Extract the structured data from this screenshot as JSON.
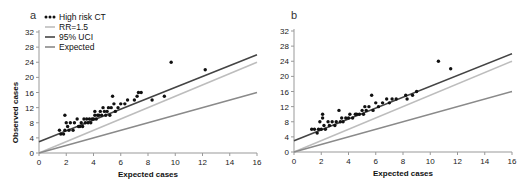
{
  "chart_data": [
    {
      "type": "scatter",
      "panel_label": "a",
      "xlabel": "Expected cases",
      "ylabel": "Observed cases",
      "xlim": [
        0,
        16
      ],
      "ylim": [
        0,
        32
      ],
      "xticks": [
        0,
        2,
        4,
        6,
        8,
        10,
        12,
        14,
        16
      ],
      "yticks": [
        0,
        4,
        8,
        12,
        16,
        20,
        24,
        28,
        32
      ],
      "grid": false,
      "legend_position": "upper-left",
      "legend": [
        "High risk CT",
        "RR=1.5",
        "95% UCI",
        "Expected"
      ],
      "lines": [
        {
          "name": "RR=1.5",
          "x": [
            0,
            16
          ],
          "y": [
            0,
            24
          ],
          "color": "#bdbdbd"
        },
        {
          "name": "95% UCI",
          "x": [
            0,
            16
          ],
          "y": [
            3,
            26
          ],
          "color": "#444444"
        },
        {
          "name": "Expected",
          "x": [
            0,
            16
          ],
          "y": [
            0,
            16
          ],
          "color": "#8a8a8a"
        }
      ],
      "series": [
        {
          "name": "High risk CT",
          "color": "#111111",
          "points": [
            [
              1.5,
              6
            ],
            [
              1.6,
              5
            ],
            [
              1.8,
              5
            ],
            [
              1.9,
              10
            ],
            [
              1.9,
              6
            ],
            [
              2.0,
              8
            ],
            [
              2.1,
              7
            ],
            [
              2.2,
              6
            ],
            [
              2.3,
              8
            ],
            [
              2.5,
              6
            ],
            [
              2.6,
              8
            ],
            [
              2.8,
              9
            ],
            [
              2.9,
              7
            ],
            [
              3.0,
              7
            ],
            [
              3.1,
              8
            ],
            [
              3.2,
              7
            ],
            [
              3.3,
              9
            ],
            [
              3.4,
              8
            ],
            [
              3.5,
              9
            ],
            [
              3.6,
              8
            ],
            [
              3.7,
              9
            ],
            [
              3.8,
              8
            ],
            [
              3.9,
              9
            ],
            [
              4.0,
              9
            ],
            [
              4.1,
              10
            ],
            [
              4.1,
              11
            ],
            [
              4.2,
              9
            ],
            [
              4.3,
              10
            ],
            [
              4.4,
              10
            ],
            [
              4.5,
              11
            ],
            [
              4.6,
              10
            ],
            [
              4.7,
              12
            ],
            [
              4.8,
              11
            ],
            [
              4.9,
              10
            ],
            [
              5.0,
              11
            ],
            [
              5.1,
              12
            ],
            [
              5.2,
              10
            ],
            [
              5.3,
              12
            ],
            [
              5.4,
              15
            ],
            [
              5.5,
              13
            ],
            [
              5.6,
              11
            ],
            [
              5.8,
              12
            ],
            [
              6.0,
              13
            ],
            [
              6.3,
              13
            ],
            [
              6.5,
              14
            ],
            [
              7.0,
              14
            ],
            [
              7.2,
              15
            ],
            [
              7.3,
              16
            ],
            [
              7.5,
              16
            ],
            [
              8.3,
              14
            ],
            [
              9.2,
              15
            ],
            [
              9.7,
              24
            ],
            [
              12.2,
              22
            ]
          ]
        }
      ]
    },
    {
      "type": "scatter",
      "panel_label": "b",
      "xlabel": "Expected cases",
      "ylabel": "",
      "xlim": [
        0,
        16
      ],
      "ylim": [
        0,
        32
      ],
      "xticks": [
        0,
        2,
        4,
        6,
        8,
        10,
        12,
        14,
        16
      ],
      "yticks": [
        0,
        4,
        8,
        12,
        16,
        20,
        24,
        28,
        32
      ],
      "grid": false,
      "lines": [
        {
          "name": "RR=1.5",
          "x": [
            0,
            16
          ],
          "y": [
            0,
            24
          ],
          "color": "#bdbdbd"
        },
        {
          "name": "95% UCI",
          "x": [
            0,
            16
          ],
          "y": [
            3,
            26
          ],
          "color": "#444444"
        },
        {
          "name": "Expected",
          "x": [
            0,
            16
          ],
          "y": [
            0,
            16
          ],
          "color": "#8a8a8a"
        }
      ],
      "series": [
        {
          "name": "High risk CT",
          "color": "#111111",
          "points": [
            [
              1.3,
              6
            ],
            [
              1.5,
              6
            ],
            [
              1.7,
              5
            ],
            [
              1.8,
              6
            ],
            [
              1.9,
              8
            ],
            [
              2.0,
              6
            ],
            [
              2.1,
              9
            ],
            [
              2.1,
              10
            ],
            [
              2.2,
              7
            ],
            [
              2.3,
              6
            ],
            [
              2.5,
              8
            ],
            [
              2.6,
              7
            ],
            [
              2.8,
              8
            ],
            [
              3.0,
              7
            ],
            [
              3.1,
              8
            ],
            [
              3.3,
              11
            ],
            [
              3.4,
              8
            ],
            [
              3.5,
              9
            ],
            [
              3.6,
              8
            ],
            [
              3.8,
              9
            ],
            [
              4.0,
              9
            ],
            [
              4.1,
              10
            ],
            [
              4.3,
              9
            ],
            [
              4.5,
              10
            ],
            [
              4.6,
              10
            ],
            [
              4.8,
              10
            ],
            [
              5.0,
              11
            ],
            [
              5.1,
              10
            ],
            [
              5.2,
              12
            ],
            [
              5.3,
              11
            ],
            [
              5.5,
              12
            ],
            [
              5.7,
              15
            ],
            [
              5.8,
              11
            ],
            [
              6.0,
              13
            ],
            [
              6.2,
              12
            ],
            [
              6.5,
              13
            ],
            [
              6.8,
              14
            ],
            [
              7.0,
              13
            ],
            [
              7.2,
              14
            ],
            [
              7.5,
              14
            ],
            [
              8.2,
              15
            ],
            [
              8.3,
              14
            ],
            [
              8.7,
              15
            ],
            [
              9.0,
              16
            ],
            [
              10.6,
              24
            ],
            [
              11.5,
              22
            ]
          ]
        }
      ]
    }
  ]
}
